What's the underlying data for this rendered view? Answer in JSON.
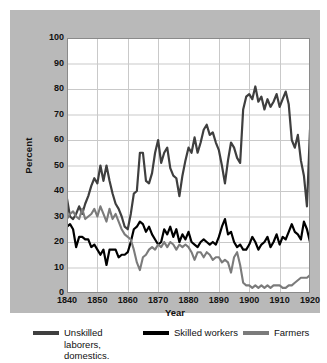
{
  "chart_data": {
    "type": "line",
    "title": "",
    "xlabel": "Year",
    "ylabel": "Percent",
    "xlim": [
      1840,
      1920
    ],
    "ylim": [
      0,
      100
    ],
    "grid": true,
    "legend_position": "bottom",
    "xticks": [
      1840,
      1850,
      1860,
      1870,
      1880,
      1890,
      1900,
      1910,
      1920
    ],
    "yticks": [
      0,
      10,
      20,
      30,
      40,
      50,
      60,
      70,
      80,
      90,
      100
    ],
    "series": [
      {
        "name": "Unskilled laborers, domestics.",
        "color": "#3f3f3f",
        "x": [
          1840,
          1841,
          1842,
          1843,
          1844,
          1845,
          1846,
          1847,
          1848,
          1849,
          1850,
          1851,
          1852,
          1853,
          1854,
          1855,
          1856,
          1857,
          1858,
          1859,
          1860,
          1861,
          1862,
          1863,
          1864,
          1865,
          1866,
          1867,
          1868,
          1869,
          1870,
          1871,
          1872,
          1873,
          1874,
          1875,
          1876,
          1877,
          1878,
          1879,
          1880,
          1881,
          1882,
          1883,
          1884,
          1885,
          1886,
          1887,
          1888,
          1889,
          1890,
          1891,
          1892,
          1893,
          1894,
          1895,
          1896,
          1897,
          1898,
          1899,
          1900,
          1901,
          1902,
          1903,
          1904,
          1905,
          1906,
          1907,
          1908,
          1909,
          1910,
          1911,
          1912,
          1913,
          1914,
          1915,
          1916,
          1917,
          1918,
          1919,
          1920
        ],
        "values": [
          37,
          30,
          29,
          31,
          34,
          31,
          35,
          38,
          42,
          45,
          43,
          50,
          44,
          50,
          44,
          39,
          35,
          33,
          30,
          26,
          25,
          31,
          39,
          40,
          55,
          55,
          44,
          43,
          47,
          55,
          60,
          51,
          55,
          57,
          49,
          46,
          45,
          38,
          46,
          52,
          57,
          55,
          61,
          55,
          59,
          64,
          66,
          62,
          63,
          59,
          56,
          50,
          43,
          52,
          59,
          57,
          53,
          51,
          72,
          77,
          78,
          76,
          81,
          75,
          77,
          72,
          76,
          73,
          75,
          78,
          73,
          76,
          79,
          74,
          60,
          57,
          62,
          52,
          46,
          34,
          64
        ]
      },
      {
        "name": "Skilled workers",
        "color": "#000000",
        "x": [
          1840,
          1841,
          1842,
          1843,
          1844,
          1845,
          1846,
          1847,
          1848,
          1849,
          1850,
          1851,
          1852,
          1853,
          1854,
          1855,
          1856,
          1857,
          1858,
          1859,
          1860,
          1861,
          1862,
          1863,
          1864,
          1865,
          1866,
          1867,
          1868,
          1869,
          1870,
          1871,
          1872,
          1873,
          1874,
          1875,
          1876,
          1877,
          1878,
          1879,
          1880,
          1881,
          1882,
          1883,
          1884,
          1885,
          1886,
          1887,
          1888,
          1889,
          1890,
          1891,
          1892,
          1893,
          1894,
          1895,
          1896,
          1897,
          1898,
          1899,
          1900,
          1901,
          1902,
          1903,
          1904,
          1905,
          1906,
          1907,
          1908,
          1909,
          1910,
          1911,
          1912,
          1913,
          1914,
          1915,
          1916,
          1917,
          1918,
          1919,
          1920
        ],
        "values": [
          26,
          27,
          25,
          18,
          22,
          22,
          21,
          21,
          18,
          19,
          17,
          15,
          17,
          11,
          17,
          17,
          17,
          14,
          15,
          15,
          16,
          20,
          25,
          26,
          28,
          27,
          24,
          26,
          23,
          21,
          19,
          20,
          25,
          23,
          26,
          22,
          25,
          20,
          23,
          21,
          24,
          20,
          19,
          18,
          20,
          21,
          20,
          19,
          20,
          19,
          22,
          26,
          29,
          23,
          24,
          20,
          18,
          19,
          17,
          17,
          19,
          22,
          20,
          17,
          19,
          20,
          22,
          18,
          20,
          23,
          19,
          22,
          21,
          24,
          27,
          24,
          23,
          21,
          28,
          25,
          20
        ]
      },
      {
        "name": "Farmers",
        "color": "#7b7b7b",
        "x": [
          1840,
          1841,
          1842,
          1843,
          1844,
          1845,
          1846,
          1847,
          1848,
          1849,
          1850,
          1851,
          1852,
          1853,
          1854,
          1855,
          1856,
          1857,
          1858,
          1859,
          1860,
          1861,
          1862,
          1863,
          1864,
          1865,
          1866,
          1867,
          1868,
          1869,
          1870,
          1871,
          1872,
          1873,
          1874,
          1875,
          1876,
          1877,
          1878,
          1879,
          1880,
          1881,
          1882,
          1883,
          1884,
          1885,
          1886,
          1887,
          1888,
          1889,
          1890,
          1891,
          1892,
          1893,
          1894,
          1895,
          1896,
          1897,
          1898,
          1899,
          1900,
          1901,
          1902,
          1903,
          1904,
          1905,
          1906,
          1907,
          1908,
          1909,
          1910,
          1911,
          1912,
          1913,
          1914,
          1915,
          1916,
          1917,
          1918,
          1919,
          1920
        ],
        "values": [
          29,
          31,
          32,
          30,
          29,
          33,
          29,
          30,
          31,
          33,
          30,
          34,
          31,
          28,
          33,
          29,
          31,
          28,
          25,
          23,
          22,
          21,
          17,
          12,
          9,
          14,
          15,
          17,
          18,
          17,
          19,
          18,
          20,
          18,
          20,
          19,
          17,
          19,
          18,
          19,
          18,
          16,
          13,
          16,
          16,
          14,
          16,
          15,
          13,
          14,
          14,
          12,
          13,
          12,
          8,
          14,
          16,
          11,
          4,
          3,
          3,
          2,
          3,
          2,
          3,
          2,
          3,
          2,
          3,
          3,
          3,
          2,
          2,
          3,
          3,
          4,
          5,
          6,
          6,
          6,
          7
        ]
      }
    ]
  },
  "legend": {
    "items": [
      {
        "label": "Unskilled laborers, domestics.",
        "color": "#3f3f3f"
      },
      {
        "label": "Skilled workers",
        "color": "#000000"
      },
      {
        "label": "Farmers",
        "color": "#7b7b7b"
      }
    ]
  },
  "axes": {
    "ylabel": "Percent",
    "xlabel": "Year"
  }
}
